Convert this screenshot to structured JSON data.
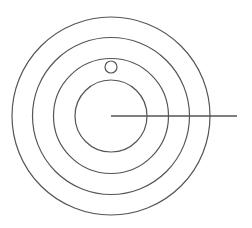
{
  "diagram": {
    "stroke_color": "#555555",
    "background": "#ffffff",
    "center": {
      "x": 111,
      "y": 116
    },
    "rings": [
      {
        "name": "ring-1-inner",
        "r": 36
      },
      {
        "name": "ring-2",
        "r": 57.5
      },
      {
        "name": "ring-3",
        "r": 78.5
      },
      {
        "name": "ring-4-outer",
        "r": 99
      }
    ],
    "small_circle": {
      "cx": 111,
      "cy": 67,
      "r": 6
    },
    "radial_line": {
      "x1": 111,
      "y1": 116,
      "x2": 237,
      "y2": 116
    }
  }
}
